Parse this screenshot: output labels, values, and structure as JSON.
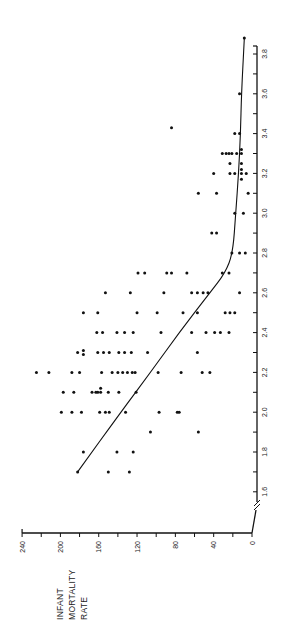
{
  "chart_data": {
    "type": "scatter",
    "orientation": "rotated-90-ccw",
    "title": "",
    "xlabel": "",
    "ylabel": "INFANT MORTALITY RATE",
    "ylabel_lines": [
      "INFANT",
      "MORTALITY",
      "RATE"
    ],
    "xlim": [
      1.5,
      3.9
    ],
    "ylim": [
      0,
      240
    ],
    "x_ticks": [
      1.6,
      1.8,
      2.0,
      2.2,
      2.4,
      2.6,
      2.8,
      3.0,
      3.2,
      3.4,
      3.6,
      3.8
    ],
    "x_tick_labels": [
      "1.6",
      "1.8",
      "2.0",
      "2.2",
      "2.4",
      "2.6",
      "2.8",
      "3.0",
      "3.2",
      "3.4",
      "3.6",
      "3.8"
    ],
    "y_ticks": [
      0,
      40,
      80,
      120,
      160,
      200,
      240
    ],
    "y_tick_labels": [
      "0",
      "40",
      "80",
      "120",
      "160",
      "200",
      "240"
    ],
    "x_axis_break": true,
    "grid": false,
    "legend": null,
    "points": [
      [
        1.7,
        182
      ],
      [
        1.7,
        150
      ],
      [
        1.7,
        128
      ],
      [
        1.8,
        176
      ],
      [
        1.8,
        141
      ],
      [
        1.8,
        124
      ],
      [
        1.9,
        106
      ],
      [
        1.9,
        56
      ],
      [
        2.0,
        199
      ],
      [
        2.0,
        188
      ],
      [
        2.0,
        178
      ],
      [
        2.0,
        159
      ],
      [
        2.0,
        153
      ],
      [
        2.0,
        149
      ],
      [
        2.0,
        132
      ],
      [
        2.0,
        97
      ],
      [
        2.0,
        76
      ],
      [
        2.0,
        78
      ],
      [
        2.1,
        197
      ],
      [
        2.1,
        186
      ],
      [
        2.1,
        167
      ],
      [
        2.1,
        163
      ],
      [
        2.1,
        161
      ],
      [
        2.1,
        158
      ],
      [
        2.12,
        158
      ],
      [
        2.1,
        150
      ],
      [
        2.1,
        139
      ],
      [
        2.1,
        121
      ],
      [
        2.2,
        225
      ],
      [
        2.2,
        212
      ],
      [
        2.2,
        188
      ],
      [
        2.2,
        180
      ],
      [
        2.2,
        157
      ],
      [
        2.2,
        146
      ],
      [
        2.2,
        140
      ],
      [
        2.2,
        135
      ],
      [
        2.2,
        130
      ],
      [
        2.2,
        125
      ],
      [
        2.2,
        122
      ],
      [
        2.2,
        98
      ],
      [
        2.2,
        74
      ],
      [
        2.2,
        52
      ],
      [
        2.2,
        44
      ],
      [
        2.3,
        182
      ],
      [
        2.31,
        176
      ],
      [
        2.29,
        176
      ],
      [
        2.3,
        161
      ],
      [
        2.3,
        155
      ],
      [
        2.3,
        149
      ],
      [
        2.3,
        139
      ],
      [
        2.3,
        133
      ],
      [
        2.3,
        126
      ],
      [
        2.3,
        109
      ],
      [
        2.3,
        57
      ],
      [
        2.4,
        162
      ],
      [
        2.4,
        156
      ],
      [
        2.4,
        141
      ],
      [
        2.4,
        133
      ],
      [
        2.4,
        124
      ],
      [
        2.4,
        95
      ],
      [
        2.4,
        63
      ],
      [
        2.4,
        48
      ],
      [
        2.4,
        39
      ],
      [
        2.4,
        33
      ],
      [
        2.4,
        24
      ],
      [
        2.5,
        176
      ],
      [
        2.5,
        161
      ],
      [
        2.5,
        120
      ],
      [
        2.5,
        99
      ],
      [
        2.5,
        72
      ],
      [
        2.5,
        57
      ],
      [
        2.5,
        28
      ],
      [
        2.5,
        23
      ],
      [
        2.5,
        18
      ],
      [
        2.6,
        153
      ],
      [
        2.6,
        127
      ],
      [
        2.6,
        92
      ],
      [
        2.6,
        63
      ],
      [
        2.6,
        57
      ],
      [
        2.6,
        51
      ],
      [
        2.6,
        46
      ],
      [
        2.6,
        13
      ],
      [
        2.7,
        119
      ],
      [
        2.7,
        112
      ],
      [
        2.7,
        89
      ],
      [
        2.7,
        84
      ],
      [
        2.7,
        68
      ],
      [
        2.7,
        31
      ],
      [
        2.7,
        24
      ],
      [
        2.8,
        21
      ],
      [
        2.8,
        13
      ],
      [
        2.8,
        7
      ],
      [
        2.9,
        42
      ],
      [
        2.9,
        37
      ],
      [
        3.0,
        18
      ],
      [
        3.0,
        9
      ],
      [
        3.1,
        56
      ],
      [
        3.1,
        37
      ],
      [
        3.1,
        4
      ],
      [
        3.2,
        40
      ],
      [
        3.2,
        23
      ],
      [
        3.2,
        18
      ],
      [
        3.2,
        11
      ],
      [
        3.2,
        6
      ],
      [
        3.17,
        11
      ],
      [
        3.22,
        11
      ],
      [
        3.25,
        11
      ],
      [
        3.25,
        23
      ],
      [
        3.3,
        31
      ],
      [
        3.3,
        27
      ],
      [
        3.3,
        24
      ],
      [
        3.3,
        21
      ],
      [
        3.3,
        16
      ],
      [
        3.3,
        11
      ],
      [
        3.32,
        11
      ],
      [
        3.4,
        18
      ],
      [
        3.4,
        13
      ],
      [
        3.43,
        84
      ],
      [
        3.6,
        13
      ],
      [
        3.88,
        8
      ]
    ],
    "fit_line": {
      "type": "piecewise-curve",
      "points": [
        [
          1.7,
          182
        ],
        [
          2.0,
          137
        ],
        [
          2.2,
          106
        ],
        [
          2.4,
          76
        ],
        [
          2.6,
          44
        ],
        [
          2.7,
          28
        ],
        [
          2.8,
          20
        ],
        [
          3.0,
          17
        ],
        [
          3.2,
          14
        ],
        [
          3.4,
          12
        ],
        [
          3.6,
          11
        ],
        [
          3.88,
          8
        ]
      ]
    }
  },
  "colors": {
    "ink": "#111111",
    "background": "#ffffff"
  }
}
